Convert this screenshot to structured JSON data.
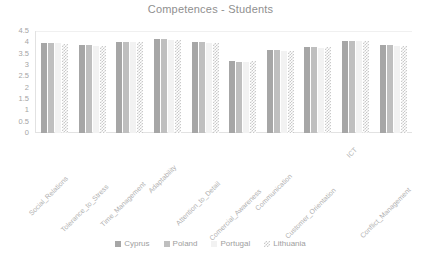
{
  "chart_data": {
    "type": "bar",
    "title": "Competences  -  Students",
    "xlabel": "",
    "ylabel": "",
    "ylim": [
      0,
      4.5
    ],
    "yticks": [
      "4.5",
      "4",
      "3.5",
      "3",
      "2.5",
      "2",
      "1.5",
      "1",
      "0.5",
      "0"
    ],
    "ytick_values": [
      4.5,
      4,
      3.5,
      3,
      2.5,
      2,
      1.5,
      1,
      0.5,
      0
    ],
    "grid": true,
    "legend_position": "bottom",
    "categories": [
      "Social_Relations",
      "Tolerance_to_Stress",
      "Time_Management",
      "Adaptability",
      "Attention_to_Detail",
      "Comercial_Awareness",
      "Communication",
      "Customer_Orientation",
      "ICT",
      "Conflict_Management"
    ],
    "series": [
      {
        "name": "Cyprus",
        "color": "#a6a6a6",
        "values": [
          3.98,
          3.87,
          4.03,
          4.15,
          4.02,
          3.16,
          3.65,
          3.8,
          4.08,
          3.88
        ]
      },
      {
        "name": "Poland",
        "color": "#bfbfbf",
        "values": [
          3.98,
          3.87,
          4.03,
          4.15,
          4.02,
          3.14,
          3.67,
          3.8,
          4.08,
          3.88
        ]
      },
      {
        "name": "Portugal",
        "color": "#f2f2f2",
        "values": [
          3.95,
          3.84,
          4.0,
          4.12,
          3.99,
          3.12,
          3.63,
          3.77,
          4.05,
          3.85
        ]
      },
      {
        "name": "Lithuania",
        "color": "#c9c9c9",
        "pattern": "checkered",
        "values": [
          3.93,
          3.84,
          4.0,
          4.12,
          3.99,
          3.16,
          3.62,
          3.78,
          4.07,
          3.84
        ]
      }
    ]
  },
  "legend": {
    "items": [
      {
        "label": "Cyprus"
      },
      {
        "label": "Poland"
      },
      {
        "label": "Portugal"
      },
      {
        "label": "Lithuania"
      }
    ]
  }
}
